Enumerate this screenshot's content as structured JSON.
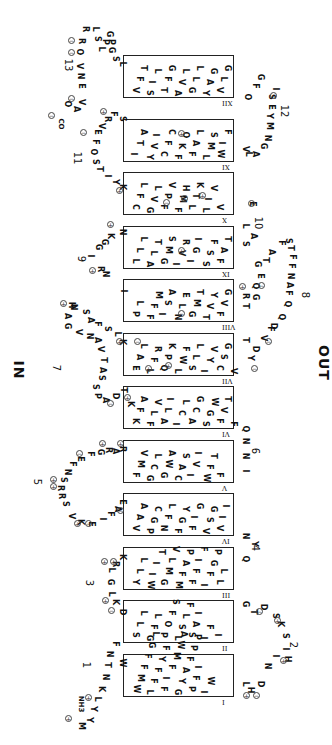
{
  "sides": {
    "in": "IN",
    "out": "OUT"
  },
  "terminals": {
    "n": "NH3",
    "c": "CO"
  },
  "helices": [
    {
      "id": "I",
      "top": 654,
      "rows": [
        "WMFFGL",
        "LFFYF",
        "FIFMWA",
        "GYAFPP",
        "PFI",
        "IW"
      ]
    },
    {
      "id": "II",
      "top": 600,
      "rows": [
        "SLL",
        "GFL",
        "POFS",
        "LSLF",
        "SAI",
        "IF",
        "I"
      ]
    },
    {
      "id": "III",
      "top": 547,
      "rows": [
        "YLL",
        "WIIT",
        "GMLV",
        "MFAP",
        "FFIF",
        "IFGP",
        "LL"
      ]
    },
    {
      "id": "IV",
      "top": 493,
      "rows": [
        "VAA",
        "PGC",
        "NFL",
        "FGY",
        "FIG",
        "VSG",
        "VII"
      ]
    },
    {
      "id": "V",
      "top": 440,
      "rows": [
        "FMV",
        "GCL",
        "GWA",
        "CAS",
        "IVI",
        "WFT",
        "F"
      ]
    },
    {
      "id": "VI",
      "top": 386,
      "rows": [
        "KFA",
        "FLV",
        "ALI",
        "ICL",
        "ACG",
        "SGW",
        "FVT",
        "F"
      ]
    },
    {
      "id": "VII",
      "top": 333,
      "rows": [
        "EAL",
        "LFR",
        "QPK",
        "LWF",
        "SLL",
        "IYV",
        "CSG",
        "V"
      ]
    },
    {
      "id": "VIII",
      "top": 279,
      "rows": [
        "PL",
        "FFM",
        "ISA",
        "NLE",
        "GMT",
        "TVY",
        "FVG"
      ]
    },
    {
      "id": "IX",
      "top": 226,
      "rows": [
        "LLL",
        "ALT",
        "GMS",
        "IVR",
        "IGI",
        "SSF",
        "FAT"
      ]
    },
    {
      "id": "X",
      "top": 172,
      "rows": [
        "CFL",
        "GVL",
        "FPV",
        "FMH",
        "LTK",
        "LIV",
        "V"
      ]
    },
    {
      "id": "XI",
      "top": 119,
      "rows": [
        "ITA",
        "YVI",
        "CFC",
        "FKO",
        "FAL",
        "LMS",
        "WIF"
      ]
    },
    {
      "id": "XII",
      "top": 55,
      "rows": [
        "VFT",
        "SIL",
        "TFG",
        "AVL",
        "GLL",
        "YAG",
        "VLG"
      ]
    }
  ],
  "loops": [
    {
      "num": "1",
      "num_pos": [
        83,
        660
      ]
    },
    {
      "num": "2",
      "num_pos": [
        290,
        640
      ]
    },
    {
      "num": "3",
      "num_pos": [
        86,
        578
      ]
    },
    {
      "num": "4",
      "num_pos": [
        252,
        543
      ]
    },
    {
      "num": "5",
      "num_pos": [
        34,
        477
      ]
    },
    {
      "num": "6",
      "num_pos": [
        252,
        446
      ]
    },
    {
      "num": "7",
      "num_pos": [
        53,
        363
      ]
    },
    {
      "num": "8",
      "num_pos": [
        302,
        290
      ]
    },
    {
      "num": "9",
      "num_pos": [
        78,
        254
      ]
    },
    {
      "num": "10",
      "num_pos": [
        252,
        218
      ]
    },
    {
      "num": "11",
      "num_pos": [
        71,
        153
      ]
    },
    {
      "num": "12",
      "num_pos": [
        278,
        106
      ]
    },
    {
      "num": "13",
      "num_pos": [
        62,
        60
      ]
    }
  ],
  "loop_residues": [
    {
      "t": "M",
      "x": 76,
      "y": 722
    },
    {
      "t": "Y",
      "x": 84,
      "y": 716
    },
    {
      "t": "Y",
      "x": 88,
      "y": 705
    },
    {
      "t": "L",
      "x": 92,
      "y": 695
    },
    {
      "t": "K",
      "x": 96,
      "y": 685
    },
    {
      "t": "N",
      "x": 100,
      "y": 673
    },
    {
      "t": "T",
      "x": 102,
      "y": 661
    },
    {
      "t": "N",
      "x": 104,
      "y": 650
    },
    {
      "t": "F",
      "x": 110,
      "y": 640
    },
    {
      "t": "W",
      "x": 117,
      "y": 659
    },
    {
      "t": "L",
      "x": 240,
      "y": 680
    },
    {
      "t": "H",
      "x": 245,
      "y": 686
    },
    {
      "t": "D",
      "x": 255,
      "y": 680
    },
    {
      "t": "N",
      "x": 262,
      "y": 662
    },
    {
      "t": "I",
      "x": 270,
      "y": 652
    },
    {
      "t": "H",
      "x": 282,
      "y": 655
    },
    {
      "t": "I",
      "x": 280,
      "y": 645
    },
    {
      "t": "S",
      "x": 280,
      "y": 632
    },
    {
      "t": "K",
      "x": 275,
      "y": 620
    },
    {
      "t": "S",
      "x": 270,
      "y": 612
    },
    {
      "t": "D",
      "x": 258,
      "y": 603
    },
    {
      "t": "T",
      "x": 248,
      "y": 608
    },
    {
      "t": "G",
      "x": 240,
      "y": 600
    },
    {
      "t": "D",
      "x": 117,
      "y": 608
    },
    {
      "t": "K",
      "x": 110,
      "y": 598
    },
    {
      "t": "L",
      "x": 106,
      "y": 590
    },
    {
      "t": "G",
      "x": 105,
      "y": 578
    },
    {
      "t": "L",
      "x": 106,
      "y": 566
    },
    {
      "t": "R",
      "x": 110,
      "y": 560
    },
    {
      "t": "K",
      "x": 117,
      "y": 553
    },
    {
      "t": "Q",
      "x": 240,
      "y": 555
    },
    {
      "t": "Y",
      "x": 249,
      "y": 540
    },
    {
      "t": "N",
      "x": 240,
      "y": 532
    },
    {
      "t": "E",
      "x": 117,
      "y": 498
    },
    {
      "t": "A",
      "x": 112,
      "y": 505
    },
    {
      "t": "F",
      "x": 105,
      "y": 510
    },
    {
      "t": "I",
      "x": 97,
      "y": 515
    },
    {
      "t": "E",
      "x": 86,
      "y": 520
    },
    {
      "t": "K",
      "x": 75,
      "y": 518
    },
    {
      "t": "V",
      "x": 66,
      "y": 512
    },
    {
      "t": "S",
      "x": 60,
      "y": 500
    },
    {
      "t": "R",
      "x": 56,
      "y": 492
    },
    {
      "t": "R",
      "x": 55,
      "y": 484
    },
    {
      "t": "S",
      "x": 58,
      "y": 476
    },
    {
      "t": "N",
      "x": 62,
      "y": 468
    },
    {
      "t": "F",
      "x": 67,
      "y": 460
    },
    {
      "t": "E",
      "x": 75,
      "y": 455
    },
    {
      "t": "F",
      "x": 85,
      "y": 450
    },
    {
      "t": "G",
      "x": 95,
      "y": 448
    },
    {
      "t": "R",
      "x": 103,
      "y": 446
    },
    {
      "t": "A",
      "x": 110,
      "y": 447
    },
    {
      "t": "R",
      "x": 117,
      "y": 445
    },
    {
      "t": "N",
      "x": 240,
      "y": 437
    },
    {
      "t": "N",
      "x": 240,
      "y": 452
    },
    {
      "t": "I",
      "x": 240,
      "y": 467
    },
    {
      "t": "Q",
      "x": 240,
      "y": 425
    },
    {
      "t": "K",
      "x": 125,
      "y": 400
    },
    {
      "t": "T",
      "x": 118,
      "y": 386
    },
    {
      "t": "D",
      "x": 110,
      "y": 392
    },
    {
      "t": "A",
      "x": 100,
      "y": 396
    },
    {
      "t": "P",
      "x": 92,
      "y": 392
    },
    {
      "t": "S",
      "x": 90,
      "y": 383
    },
    {
      "t": "S",
      "x": 96,
      "y": 374
    },
    {
      "t": "A",
      "x": 97,
      "y": 366
    },
    {
      "t": "T",
      "x": 98,
      "y": 356
    },
    {
      "t": "V",
      "x": 95,
      "y": 345
    },
    {
      "t": "A",
      "x": 92,
      "y": 336
    },
    {
      "t": "N",
      "x": 84,
      "y": 332
    },
    {
      "t": "V",
      "x": 73,
      "y": 328
    },
    {
      "t": "G",
      "x": 62,
      "y": 322
    },
    {
      "t": "A",
      "x": 62,
      "y": 312
    },
    {
      "t": "N",
      "x": 68,
      "y": 303
    },
    {
      "t": "H",
      "x": 66,
      "y": 301
    },
    {
      "t": "S",
      "x": 80,
      "y": 308
    },
    {
      "t": "A",
      "x": 85,
      "y": 316
    },
    {
      "t": "F",
      "x": 92,
      "y": 320
    },
    {
      "t": "S",
      "x": 102,
      "y": 325
    },
    {
      "t": "L",
      "x": 112,
      "y": 330
    },
    {
      "t": "K",
      "x": 117,
      "y": 338
    },
    {
      "t": "T",
      "x": 240,
      "y": 336
    },
    {
      "t": "Y",
      "x": 245,
      "y": 354
    },
    {
      "t": "D",
      "x": 250,
      "y": 345
    },
    {
      "t": "V",
      "x": 258,
      "y": 334
    },
    {
      "t": "F",
      "x": 265,
      "y": 325
    },
    {
      "t": "D",
      "x": 268,
      "y": 322
    },
    {
      "t": "Q",
      "x": 276,
      "y": 313
    },
    {
      "t": "Q",
      "x": 282,
      "y": 300
    },
    {
      "t": "F",
      "x": 283,
      "y": 289
    },
    {
      "t": "A",
      "x": 284,
      "y": 281
    },
    {
      "t": "N",
      "x": 285,
      "y": 272
    },
    {
      "t": "F",
      "x": 286,
      "y": 262
    },
    {
      "t": "F",
      "x": 287,
      "y": 253
    },
    {
      "t": "T",
      "x": 285,
      "y": 244
    },
    {
      "t": "S",
      "x": 283,
      "y": 237
    },
    {
      "t": "F",
      "x": 276,
      "y": 239
    },
    {
      "t": "A",
      "x": 266,
      "y": 248
    },
    {
      "t": "T",
      "x": 260,
      "y": 256
    },
    {
      "t": "G",
      "x": 252,
      "y": 260
    },
    {
      "t": "E",
      "x": 255,
      "y": 272
    },
    {
      "t": "Q",
      "x": 250,
      "y": 282
    },
    {
      "t": "G",
      "x": 250,
      "y": 293
    },
    {
      "t": "R",
      "x": 240,
      "y": 292
    },
    {
      "t": "T",
      "x": 240,
      "y": 302
    },
    {
      "t": "I",
      "x": 118,
      "y": 287
    },
    {
      "t": "N",
      "x": 100,
      "y": 270
    },
    {
      "t": "R",
      "x": 95,
      "y": 265
    },
    {
      "t": "I",
      "x": 85,
      "y": 252
    },
    {
      "t": "G",
      "x": 93,
      "y": 243
    },
    {
      "t": "G",
      "x": 99,
      "y": 238
    },
    {
      "t": "K",
      "x": 105,
      "y": 232
    },
    {
      "t": "N",
      "x": 117,
      "y": 228
    },
    {
      "t": "S",
      "x": 240,
      "y": 240
    },
    {
      "t": "A",
      "x": 248,
      "y": 232
    },
    {
      "t": "L",
      "x": 240,
      "y": 222
    },
    {
      "t": "E",
      "x": 247,
      "y": 200
    },
    {
      "t": "K",
      "x": 117,
      "y": 183
    },
    {
      "t": "Y",
      "x": 110,
      "y": 178
    },
    {
      "t": "I",
      "x": 102,
      "y": 172
    },
    {
      "t": "T",
      "x": 94,
      "y": 165
    },
    {
      "t": "S",
      "x": 90,
      "y": 158
    },
    {
      "t": "O",
      "x": 88,
      "y": 148
    },
    {
      "t": "F",
      "x": 90,
      "y": 138
    },
    {
      "t": "E",
      "x": 92,
      "y": 128
    },
    {
      "t": "V",
      "x": 96,
      "y": 122
    },
    {
      "t": "R",
      "x": 102,
      "y": 115
    },
    {
      "t": "F",
      "x": 108,
      "y": 110
    },
    {
      "t": "S",
      "x": 117,
      "y": 115
    },
    {
      "t": "V",
      "x": 240,
      "y": 145
    },
    {
      "t": "L",
      "x": 243,
      "y": 150
    },
    {
      "t": "A",
      "x": 250,
      "y": 150
    },
    {
      "t": "G",
      "x": 258,
      "y": 142
    },
    {
      "t": "N",
      "x": 262,
      "y": 134
    },
    {
      "t": "M",
      "x": 264,
      "y": 122
    },
    {
      "t": "Y",
      "x": 264,
      "y": 112
    },
    {
      "t": "E",
      "x": 266,
      "y": 103
    },
    {
      "t": "S",
      "x": 266,
      "y": 93
    },
    {
      "t": "I",
      "x": 270,
      "y": 85
    },
    {
      "t": "G",
      "x": 255,
      "y": 73
    },
    {
      "t": "F",
      "x": 250,
      "y": 82
    },
    {
      "t": "O",
      "x": 242,
      "y": 93
    },
    {
      "t": "L",
      "x": 117,
      "y": 60
    },
    {
      "t": "S",
      "x": 110,
      "y": 55
    },
    {
      "t": "G",
      "x": 106,
      "y": 46
    },
    {
      "t": "P",
      "x": 106,
      "y": 38
    },
    {
      "t": "G",
      "x": 104,
      "y": 30
    },
    {
      "t": "P",
      "x": 100,
      "y": 38
    },
    {
      "t": "L",
      "x": 96,
      "y": 45
    },
    {
      "t": "L",
      "x": 90,
      "y": 25
    },
    {
      "t": "S",
      "x": 92,
      "y": 35
    },
    {
      "t": "R",
      "x": 80,
      "y": 25
    },
    {
      "t": "R",
      "x": 76,
      "y": 37
    },
    {
      "t": "O",
      "x": 74,
      "y": 48
    },
    {
      "t": "V",
      "x": 74,
      "y": 62
    },
    {
      "t": "N",
      "x": 75,
      "y": 72
    },
    {
      "t": "E",
      "x": 76,
      "y": 82
    },
    {
      "t": "V",
      "x": 76,
      "y": 98
    },
    {
      "t": "A",
      "x": 71,
      "y": 105
    },
    {
      "t": "O",
      "x": 62,
      "y": 100
    }
  ],
  "charges": [
    {
      "s": "+",
      "x": 65,
      "y": 715
    },
    {
      "s": "+",
      "x": 85,
      "y": 694
    },
    {
      "s": "-",
      "x": 108,
      "y": 607
    },
    {
      "s": "+",
      "x": 102,
      "y": 597
    },
    {
      "s": "+",
      "x": 101,
      "y": 558
    },
    {
      "s": "+",
      "x": 110,
      "y": 558
    },
    {
      "s": "+",
      "x": 243,
      "y": 692
    },
    {
      "s": "-",
      "x": 253,
      "y": 692
    },
    {
      "s": "+",
      "x": 280,
      "y": 657
    },
    {
      "s": "+",
      "x": 274,
      "y": 617
    },
    {
      "s": "-",
      "x": 256,
      "y": 608
    },
    {
      "s": "-",
      "x": 117,
      "y": 507
    },
    {
      "s": "+",
      "x": 74,
      "y": 520
    },
    {
      "s": "-",
      "x": 85,
      "y": 520
    },
    {
      "s": "+",
      "x": 50,
      "y": 483
    },
    {
      "s": "+",
      "x": 50,
      "y": 476
    },
    {
      "s": "-",
      "x": 76,
      "y": 450
    },
    {
      "s": "+",
      "x": 99,
      "y": 440
    },
    {
      "s": "+",
      "x": 117,
      "y": 440
    },
    {
      "s": "-",
      "x": 107,
      "y": 400
    },
    {
      "s": "+",
      "x": 124,
      "y": 394
    },
    {
      "s": "+",
      "x": 116,
      "y": 338
    },
    {
      "s": "+",
      "x": 60,
      "y": 300
    },
    {
      "s": "-",
      "x": 251,
      "y": 365
    },
    {
      "s": "-",
      "x": 265,
      "y": 338
    },
    {
      "s": "+",
      "x": 239,
      "y": 283
    },
    {
      "s": "-",
      "x": 258,
      "y": 282
    },
    {
      "s": "+",
      "x": 89,
      "y": 267
    },
    {
      "s": "+",
      "x": 107,
      "y": 221
    },
    {
      "s": "-",
      "x": 248,
      "y": 200
    },
    {
      "s": "+",
      "x": 116,
      "y": 187
    },
    {
      "s": "-",
      "x": 80,
      "y": 129
    },
    {
      "s": "+",
      "x": 100,
      "y": 108
    },
    {
      "s": "-",
      "x": 270,
      "y": 92
    },
    {
      "s": "-",
      "x": 68,
      "y": 95
    },
    {
      "s": "-",
      "x": 48,
      "y": 112
    },
    {
      "s": "-",
      "x": 68,
      "y": 49
    },
    {
      "s": "-",
      "x": 68,
      "y": 37
    }
  ],
  "helix_charges": [
    {
      "s": "+",
      "x": 178,
      "y": 130
    },
    {
      "s": "-",
      "x": 163,
      "y": 199
    },
    {
      "s": "+",
      "x": 181,
      "y": 195
    },
    {
      "s": "+",
      "x": 199,
      "y": 192
    },
    {
      "s": "+",
      "x": 178,
      "y": 247
    },
    {
      "s": "-",
      "x": 178,
      "y": 310
    },
    {
      "s": "-",
      "x": 134,
      "y": 338
    },
    {
      "s": "+",
      "x": 145,
      "y": 365
    },
    {
      "s": "+",
      "x": 165,
      "y": 362
    }
  ]
}
